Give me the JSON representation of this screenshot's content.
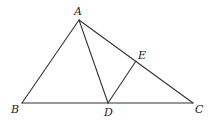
{
  "diagram": {
    "type": "geometry-triangle",
    "points": {
      "A": {
        "label": "A",
        "x": 79,
        "y": 20
      },
      "B": {
        "label": "B",
        "x": 22,
        "y": 103
      },
      "C": {
        "label": "C",
        "x": 193,
        "y": 103
      },
      "D": {
        "label": "D",
        "x": 108,
        "y": 103
      },
      "E": {
        "label": "E",
        "x": 136,
        "y": 61
      }
    },
    "segments": [
      {
        "name": "AB",
        "from": "A",
        "to": "B"
      },
      {
        "name": "BC",
        "from": "B",
        "to": "C"
      },
      {
        "name": "AC",
        "from": "A",
        "to": "C"
      },
      {
        "name": "AD",
        "from": "A",
        "to": "D"
      },
      {
        "name": "DE",
        "from": "D",
        "to": "E"
      }
    ],
    "labels": {
      "A": "A",
      "B": "B",
      "C": "C",
      "D": "D",
      "E": "E"
    },
    "line_color": "#333333"
  }
}
